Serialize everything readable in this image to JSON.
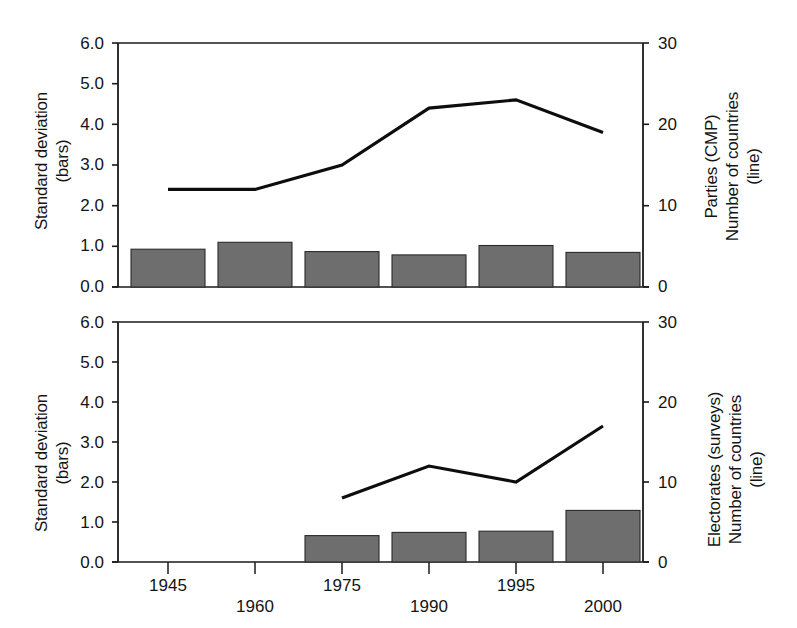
{
  "figure": {
    "background": "#ffffff",
    "bar_color": "#6e6e6e",
    "line_color": "#0d0d0d",
    "axis_color": "#1a1a1a"
  },
  "panels": [
    {
      "id": "top-panel",
      "left_axis_title_line1": "Standard deviation",
      "left_axis_title_line2": "(bars)",
      "right_axis_title_line1": "Parties (CMP)",
      "right_axis_title_line2": "Number of countries",
      "right_axis_title_line3": "(line)",
      "left_ticks": [
        "6.0",
        "5.0",
        "4.0",
        "3.0",
        "2.0",
        "1.0",
        "0.0"
      ],
      "right_ticks": [
        "30",
        "20",
        "10",
        "0"
      ],
      "x_ticks": [
        "1945",
        "1960",
        "1975",
        "1990",
        "1995",
        "2000"
      ]
    },
    {
      "id": "bottom-panel",
      "left_axis_title_line1": "Standard deviation",
      "left_axis_title_line2": "(bars)",
      "right_axis_title_line1": "Electorates (surveys)",
      "right_axis_title_line2": "Number of countries",
      "right_axis_title_line3": "(line)",
      "left_ticks": [
        "6.0",
        "5.0",
        "4.0",
        "3.0",
        "2.0",
        "1.0",
        "0.0"
      ],
      "right_ticks": [
        "30",
        "20",
        "10",
        "0"
      ],
      "x_ticks": [
        "1945",
        "1960",
        "1975",
        "1990",
        "1995",
        "2000"
      ]
    }
  ],
  "chart_data": [
    {
      "type": "bar",
      "id": "top-panel",
      "title": "",
      "xlabel": "",
      "ylabel": "Standard deviation (bars)",
      "y2label": "Parties (CMP) Number of countries (line)",
      "categories": [
        "1945",
        "1960",
        "1975",
        "1990",
        "1995",
        "2000"
      ],
      "ylim": [
        0.0,
        6.0
      ],
      "y2lim": [
        0,
        30
      ],
      "grid": false,
      "legend": "none",
      "series": [
        {
          "name": "Standard deviation (bars)",
          "kind": "bar",
          "axis": "left",
          "values": [
            0.93,
            1.1,
            0.87,
            0.79,
            1.02,
            0.85
          ]
        },
        {
          "name": "Number of countries (line)",
          "kind": "line",
          "axis": "right",
          "values": [
            12,
            12,
            15,
            22,
            23,
            19
          ]
        }
      ]
    },
    {
      "type": "bar",
      "id": "bottom-panel",
      "title": "",
      "xlabel": "",
      "ylabel": "Standard deviation (bars)",
      "y2label": "Electorates (surveys) Number of countries (line)",
      "categories": [
        "1945",
        "1960",
        "1975",
        "1990",
        "1995",
        "2000"
      ],
      "ylim": [
        0.0,
        6.0
      ],
      "y2lim": [
        0,
        30
      ],
      "grid": false,
      "legend": "none",
      "series": [
        {
          "name": "Standard deviation (bars)",
          "kind": "bar",
          "axis": "left",
          "values": [
            null,
            null,
            0.66,
            0.74,
            0.77,
            1.29
          ]
        },
        {
          "name": "Number of countries (line)",
          "kind": "line",
          "axis": "right",
          "values": [
            null,
            null,
            8,
            12,
            10,
            17
          ]
        }
      ]
    }
  ]
}
